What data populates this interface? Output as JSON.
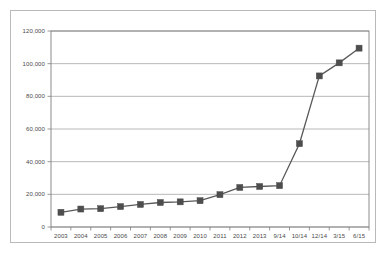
{
  "chart_data": {
    "type": "line",
    "title": "",
    "subtitle": "",
    "xlabel": "",
    "ylabel": "",
    "categories": [
      "2003",
      "2004",
      "2005",
      "2006",
      "2007",
      "2008",
      "2009",
      "2010",
      "2011",
      "2012",
      "2013",
      "9/14",
      "10/14",
      "12/14",
      "3/15",
      "6/15"
    ],
    "values": [
      9000,
      11000,
      11200,
      12500,
      13800,
      15000,
      15400,
      16100,
      19800,
      24200,
      24800,
      25300,
      51000,
      92500,
      100500,
      109500
    ],
    "series": [
      {
        "name": "Series 1",
        "values": [
          9000,
          11000,
          11200,
          12500,
          13800,
          15000,
          15400,
          16100,
          19800,
          24200,
          24800,
          25300,
          51000,
          92500,
          100500,
          109500
        ]
      }
    ],
    "ylim": [
      0,
      120000
    ],
    "y_ticks": [
      0,
      20000,
      40000,
      60000,
      80000,
      100000,
      120000
    ],
    "y_tick_labels": [
      "0",
      "20,000",
      "40,000",
      "60,000",
      "80,000",
      "100,000",
      "120,000"
    ],
    "x_tick_labels": [
      "2003",
      "2004",
      "2005",
      "2006",
      "2007",
      "2008",
      "2009",
      "2010",
      "2011",
      "2012",
      "2013",
      "9/14",
      "10/14",
      "12/14",
      "3/15",
      "6/15"
    ],
    "grid": true,
    "grid_axis": "y",
    "legend": false,
    "legend_position": "none",
    "marker": "square",
    "series_color": "#4d4d4d",
    "line_color": "#595959",
    "grid_color": "#a6a6a6",
    "axis_color": "#7f7f7f",
    "plot_background": "#ffffff",
    "frame_border_color": "#b9b9b9",
    "annotations": []
  }
}
